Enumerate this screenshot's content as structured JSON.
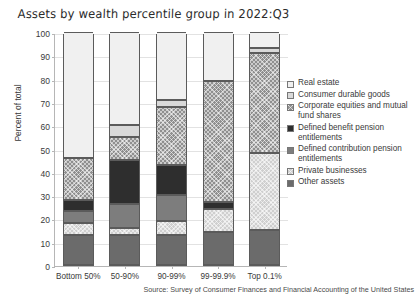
{
  "chart_data": {
    "type": "bar",
    "subtype": "stacked-bar-100",
    "title": "Assets by wealth percentile group in 2022:Q3",
    "xlabel": "",
    "ylabel": "Percent of total",
    "ylim": [
      0,
      100
    ],
    "ytick_step": 10,
    "yticks": [
      0,
      10,
      20,
      30,
      40,
      50,
      60,
      70,
      80,
      90,
      100
    ],
    "grid": true,
    "legend_position": "right",
    "source": "Source: Survey of Consumer Finances and Financial Accounting of the United States",
    "categories": [
      "Bottom 50%",
      "50-90%",
      "90-99%",
      "99-99.9%",
      "Top 0.1%"
    ],
    "series": [
      {
        "name": "Real estate",
        "color": "#f0f0f0",
        "hatch": "none",
        "values": [
          54.0,
          40.0,
          29.0,
          21.0,
          7.0
        ]
      },
      {
        "name": "Consumer durable goods",
        "color": "#d9d9d9",
        "hatch": "none",
        "values": [
          0.0,
          5.0,
          3.0,
          0.0,
          2.0
        ]
      },
      {
        "name": "Corporate equities and mutual fund shares",
        "color": "#8f8f8f",
        "hatch": "cross",
        "values": [
          18.0,
          10.0,
          25.0,
          52.0,
          43.0
        ]
      },
      {
        "name": "Defined benefit pension entitlements",
        "color": "#2e2e2e",
        "hatch": "none",
        "values": [
          5.0,
          19.0,
          13.0,
          3.0,
          0.0
        ]
      },
      {
        "name": "Defined contribution pension entitlements",
        "color": "#7d7d7d",
        "hatch": "none",
        "values": [
          5.0,
          10.0,
          11.0,
          0.0,
          0.0
        ]
      },
      {
        "name": "Private businesses",
        "color": "#cfcfcf",
        "hatch": "cross",
        "values": [
          5.0,
          3.0,
          6.0,
          10.0,
          33.0
        ]
      },
      {
        "name": "Other assets",
        "color": "#6b6b6b",
        "hatch": "none",
        "values": [
          13.0,
          13.0,
          13.0,
          14.0,
          15.0
        ]
      }
    ],
    "stack_order_bottom_to_top": [
      "Other assets",
      "Private businesses",
      "Defined contribution pension entitlements",
      "Defined benefit pension entitlements",
      "Corporate equities and mutual fund shares",
      "Consumer durable goods",
      "Real estate"
    ]
  },
  "legend": {
    "items": [
      "Real estate",
      "Consumer durable goods",
      "Corporate equities and mutual fund shares",
      "Defined benefit pension entitlements",
      "Defined contribution pension entitlements",
      "Private businesses",
      "Other assets"
    ]
  }
}
